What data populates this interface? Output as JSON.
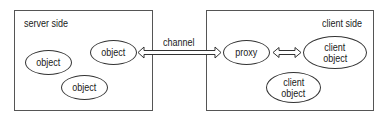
{
  "diagram": {
    "server": {
      "title": "server side",
      "objects": [
        {
          "line1": "object"
        },
        {
          "line1": "object"
        },
        {
          "line1": "object"
        }
      ]
    },
    "client": {
      "title": "client side",
      "proxy": {
        "line1": "proxy"
      },
      "objects": [
        {
          "line1": "client",
          "line2": "object"
        },
        {
          "line1": "client",
          "line2": "object"
        }
      ]
    },
    "channel": {
      "label": "channel"
    },
    "colors": {
      "line": "#333333",
      "box_border": "#555555",
      "text": "#1a1a1a"
    }
  }
}
